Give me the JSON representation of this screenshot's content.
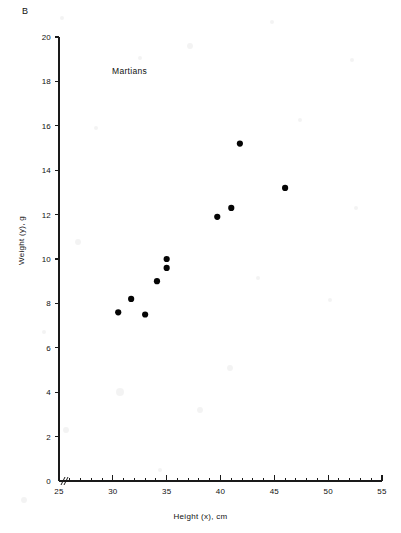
{
  "figure": {
    "panel_label": "B",
    "annotation": "Martians",
    "x_axis_title": "Height (x), cm",
    "y_axis_title": "Weight (y), g"
  },
  "chart_data": {
    "type": "scatter",
    "title": "Martians",
    "xlabel": "Height (x), cm",
    "ylabel": "Weight (y), g",
    "xlim": [
      25,
      55
    ],
    "ylim": [
      0,
      20
    ],
    "x_major_ticks": [
      25,
      30,
      35,
      40,
      45,
      50,
      55
    ],
    "x_minor_tick_step": 1,
    "y_major_ticks": [
      0,
      2,
      4,
      6,
      8,
      10,
      12,
      14,
      16,
      18,
      20
    ],
    "grid": false,
    "legend": false,
    "axis_break": true,
    "marker": "filled-circle",
    "marker_color": "#050505",
    "points": [
      {
        "x": 30.5,
        "y": 7.6
      },
      {
        "x": 31.7,
        "y": 8.2
      },
      {
        "x": 33.0,
        "y": 7.5
      },
      {
        "x": 34.1,
        "y": 9.0
      },
      {
        "x": 35.0,
        "y": 9.6
      },
      {
        "x": 35.0,
        "y": 10.0
      },
      {
        "x": 39.7,
        "y": 11.9
      },
      {
        "x": 41.0,
        "y": 12.3
      },
      {
        "x": 41.8,
        "y": 15.2
      },
      {
        "x": 46.0,
        "y": 13.2
      }
    ]
  },
  "axes_geometry": {
    "origin_px": {
      "x": 59,
      "y": 481
    },
    "x_end_px": 382,
    "y_top_px": 37,
    "px_per_x_unit": 10.7667,
    "px_per_y_unit": 22.2
  }
}
